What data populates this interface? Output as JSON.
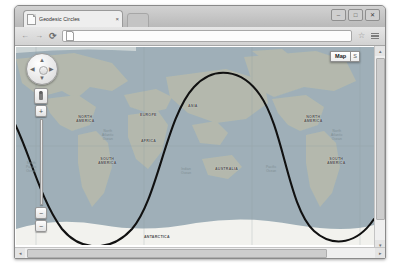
{
  "browser": {
    "tab": {
      "title": "Geodesic Circles",
      "close_label": "×",
      "favicon": "page-icon"
    },
    "window_buttons": {
      "minimize": "–",
      "maximize": "□",
      "close": "✕"
    },
    "toolbar": {
      "back": "←",
      "forward": "→",
      "reload": "⟳",
      "address_value": "",
      "address_placeholder": "",
      "bookmark": "☆",
      "menu": "menu-icon"
    }
  },
  "map": {
    "controls": {
      "pan": {
        "up": "▲",
        "down": "▼",
        "left": "◀",
        "right": "▶"
      },
      "pegman": "street-view-pegman",
      "zoom_in": "+",
      "zoom_out": "−",
      "slider_handle": "−"
    },
    "maptype": {
      "primary": "Map",
      "secondary": "S"
    },
    "labels": [
      {
        "name": "NORTH\nAMERICA",
        "x": 60,
        "y": 68,
        "kind": "continent"
      },
      {
        "name": "SOUTH\nAMERICA",
        "x": 82,
        "y": 110,
        "kind": "continent"
      },
      {
        "name": "EUROPE",
        "x": 124,
        "y": 66,
        "kind": "continent"
      },
      {
        "name": "AFRICA",
        "x": 125,
        "y": 92,
        "kind": "continent"
      },
      {
        "name": "ASIA",
        "x": 172,
        "y": 57,
        "kind": "continent"
      },
      {
        "name": "AUSTRALIA",
        "x": 199,
        "y": 120,
        "kind": "continent"
      },
      {
        "name": "NORTH\nAMERICA",
        "x": 288,
        "y": 68,
        "kind": "continent"
      },
      {
        "name": "SOUTH\nAMERICA",
        "x": 311,
        "y": 110,
        "kind": "continent"
      },
      {
        "name": "ANTARCTICA",
        "x": 128,
        "y": 188,
        "kind": "continent"
      },
      {
        "name": "North\nAtlantic\nOcean",
        "x": 86,
        "y": 82,
        "kind": "ocean"
      },
      {
        "name": "South\nPacific\nOcean",
        "x": 10,
        "y": 114,
        "kind": "ocean"
      },
      {
        "name": "Indian\nOcean",
        "x": 165,
        "y": 120,
        "kind": "ocean"
      },
      {
        "name": "Pacific\nOcean",
        "x": 250,
        "y": 118,
        "kind": "ocean"
      },
      {
        "name": "North\nAtlantic\nOcean",
        "x": 315,
        "y": 82,
        "kind": "ocean"
      }
    ]
  },
  "colors": {
    "land": "#b4b9ad",
    "ocean": "#9fb0b8",
    "curve": "#111111",
    "ice": "#f2f2ee",
    "chrome": "#d2d2d2"
  },
  "scrollbars": {
    "vertical": {
      "up": "▴",
      "down": "▾"
    },
    "horizontal": {
      "left": "◂",
      "right": "▸"
    }
  }
}
